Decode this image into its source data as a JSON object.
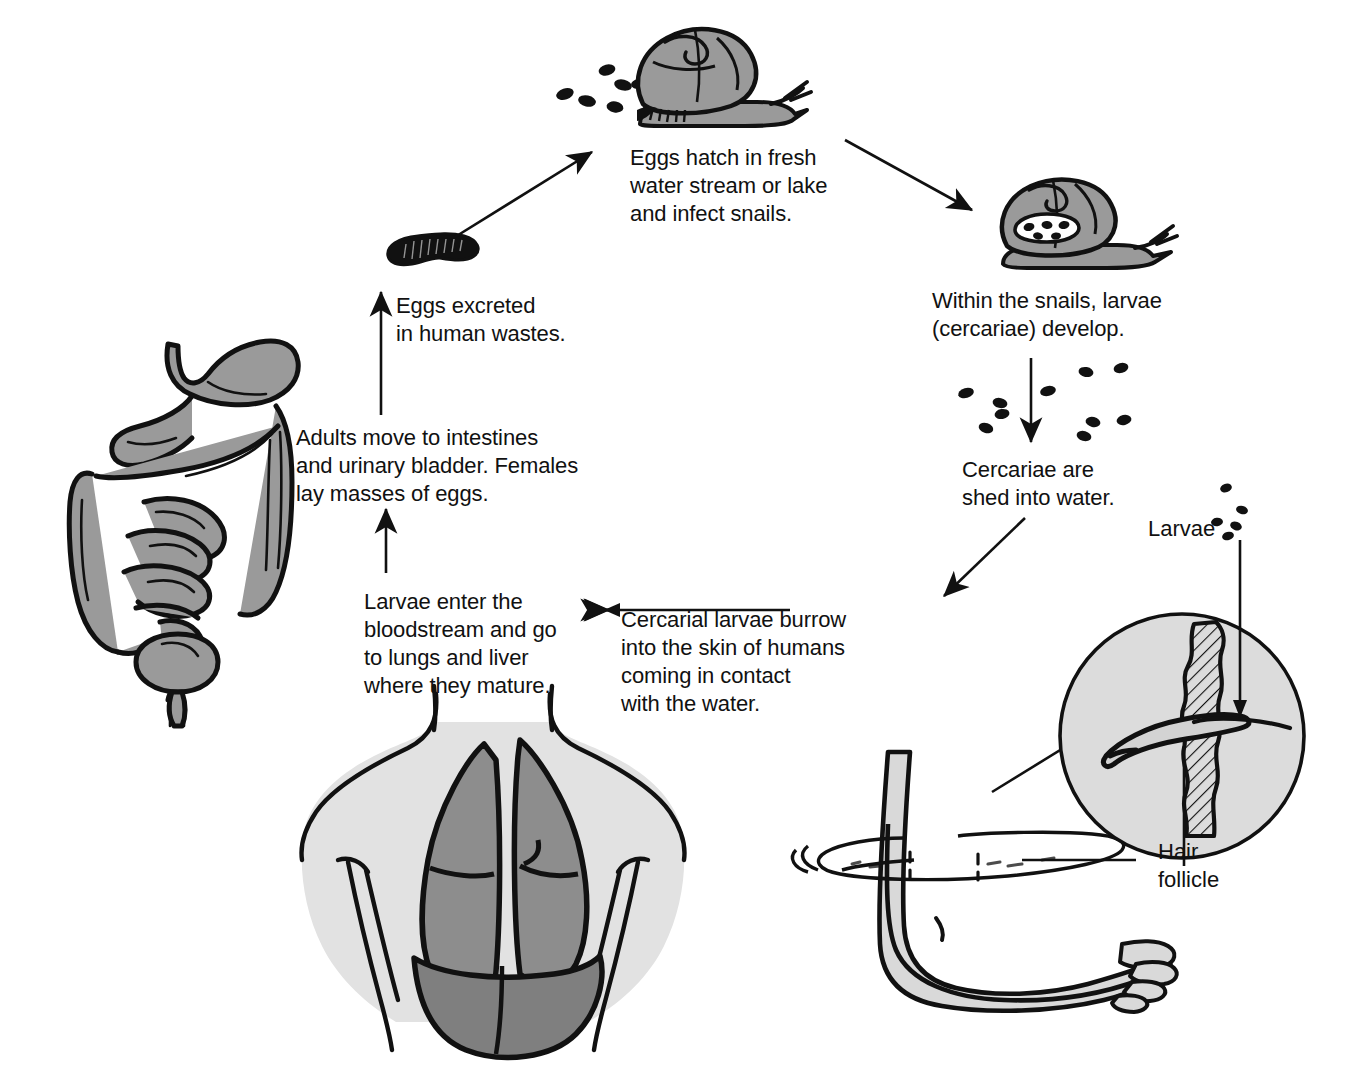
{
  "figure": {
    "background_color": "#ffffff",
    "ink_color": "#111111"
  },
  "palette": {
    "organ_gray": "#9a9a9a",
    "lung_gray": "#8d8d8d",
    "liver_gray": "#7f7f7f",
    "body_light_gray": "#e2e2e2",
    "inset_fill": "#dcdcdc",
    "outline": "#111111",
    "egg_black": "#111111"
  },
  "captions": {
    "eggs_hatch": "Eggs hatch in fresh\nwater stream or lake\nand infect snails.",
    "within_snails": "Within the snails, larvae\n(cercariae) develop.",
    "cercariae_shed": "Cercariae are\nshed into water.",
    "cercarial_burrow": "Cercarial larvae burrow\ninto the skin of humans\ncoming in contact\nwith the water.",
    "larvae_bloodstream": "Larvae enter the\nbloodstream and go\nto lungs and liver\nwhere they mature.",
    "adults_move": "Adults move to intestines\nand urinary bladder. Females\nlay masses of eggs.",
    "eggs_excreted": "Eggs excreted\nin human wastes.",
    "larvae_label": "Larvae",
    "hair_follicle_label": "Hair\nfollicle"
  },
  "illustrations": {
    "snail_top": "snail-with-eggs-illustration",
    "snail_right": "infected-snail-illustration",
    "egg_mass": "egg-mass-illustration",
    "digestive_system": "digestive-system-illustration",
    "torso_lungs": "torso-lungs-liver-illustration",
    "foot_water": "foot-in-water-illustration",
    "skin_inset": "magnified-skin-hair-follicle-inset",
    "cercariae_dots": "cercariae-dots-cluster",
    "larvae_dots": "larvae-dots-cluster"
  },
  "arrows": [
    {
      "name": "arrow-eggs-to-snail",
      "from": "egg-mass",
      "to": "snail-top"
    },
    {
      "name": "arrow-snail-to-infected-snail",
      "from": "snail-top",
      "to": "snail-right"
    },
    {
      "name": "arrow-snail-to-cercariae",
      "from": "snail-right",
      "to": "cercariae-shed"
    },
    {
      "name": "arrow-cercariae-to-skin",
      "from": "cercariae-shed",
      "to": "cercarial-burrow"
    },
    {
      "name": "arrow-burrow-to-bloodstream",
      "from": "cercarial-burrow",
      "to": "larvae-bloodstream"
    },
    {
      "name": "arrow-bloodstream-to-adults",
      "from": "larvae-bloodstream",
      "to": "adults-move"
    },
    {
      "name": "arrow-adults-to-eggs",
      "from": "adults-move",
      "to": "eggs-excreted"
    },
    {
      "name": "arrow-larvae-to-inset",
      "from": "larvae-label",
      "to": "skin-inset"
    }
  ]
}
